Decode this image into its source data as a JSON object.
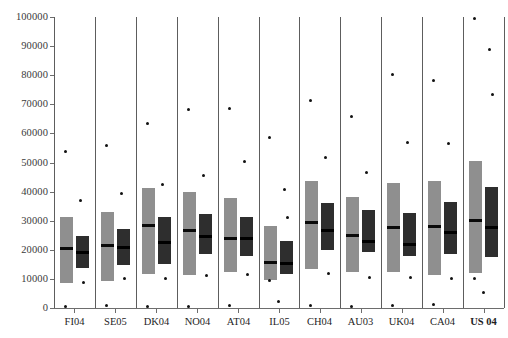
{
  "chart_data": {
    "type": "bar",
    "subtype": "paired-range-bars-with-outliers",
    "title": "",
    "subtitle": "",
    "xlabel": "",
    "ylabel": "",
    "ylim": [
      0,
      100000
    ],
    "grid": false,
    "legend_position": "none",
    "y_ticks": [
      {
        "value": 0,
        "label": "0"
      },
      {
        "value": 10000,
        "label": "10000"
      },
      {
        "value": 20000,
        "label": "20000"
      },
      {
        "value": 30000,
        "label": "30000"
      },
      {
        "value": 40000,
        "label": "40000"
      },
      {
        "value": 50000,
        "label": "50000"
      },
      {
        "value": 60000,
        "label": "60000"
      },
      {
        "value": 70000,
        "label": "70000"
      },
      {
        "value": 80000,
        "label": "80000"
      },
      {
        "value": 90000,
        "label": "90000"
      },
      {
        "value": 100000,
        "label": "100000"
      }
    ],
    "categories": [
      "FI04",
      "SE05",
      "DK04",
      "NO04",
      "AT04",
      "IL05",
      "CH04",
      "AU03",
      "UK04",
      "CA04",
      "US 04"
    ],
    "category_styles": [
      "normal",
      "normal",
      "normal",
      "normal",
      "normal",
      "normal",
      "normal",
      "normal",
      "normal",
      "normal",
      "bold"
    ],
    "series": [
      {
        "name": "light",
        "color": "#8f8f8f",
        "bars": [
          {
            "category": "FI04",
            "low": 8700,
            "high": 31300,
            "median": 20500
          },
          {
            "category": "SE05",
            "low": 9300,
            "high": 32900,
            "median": 21700
          },
          {
            "category": "DK04",
            "low": 11600,
            "high": 41100,
            "median": 28400
          },
          {
            "category": "NO04",
            "low": 11400,
            "high": 39900,
            "median": 26700
          },
          {
            "category": "AT04",
            "low": 12200,
            "high": 37800,
            "median": 23900
          },
          {
            "category": "IL05",
            "low": 9700,
            "high": 28300,
            "median": 15900
          },
          {
            "category": "CH04",
            "low": 13300,
            "high": 43600,
            "median": 29700
          },
          {
            "category": "AU03",
            "low": 12200,
            "high": 38100,
            "median": 25000
          },
          {
            "category": "UK04",
            "low": 12300,
            "high": 42900,
            "median": 27900
          },
          {
            "category": "CA04",
            "low": 11500,
            "high": 43700,
            "median": 28200
          },
          {
            "category": "US 04",
            "low": 12100,
            "high": 50600,
            "median": 30100
          }
        ]
      },
      {
        "name": "dark",
        "color": "#2e2e2e",
        "bars": [
          {
            "category": "FI04",
            "low": 13600,
            "high": 24600,
            "median": 19200
          },
          {
            "category": "SE05",
            "low": 14800,
            "high": 27200,
            "median": 20900
          },
          {
            "category": "DK04",
            "low": 15300,
            "high": 31400,
            "median": 22600
          },
          {
            "category": "NO04",
            "low": 18600,
            "high": 32200,
            "median": 24600
          },
          {
            "category": "AT04",
            "low": 17900,
            "high": 31200,
            "median": 24100
          },
          {
            "category": "IL05",
            "low": 11600,
            "high": 22900,
            "median": 15300
          },
          {
            "category": "CH04",
            "low": 20100,
            "high": 36100,
            "median": 26900
          },
          {
            "category": "AU03",
            "low": 19400,
            "high": 33700,
            "median": 23100
          },
          {
            "category": "UK04",
            "low": 17800,
            "high": 32700,
            "median": 21900
          },
          {
            "category": "CA04",
            "low": 18400,
            "high": 36400,
            "median": 26000
          },
          {
            "category": "US 04",
            "low": 17400,
            "high": 41500,
            "median": 27700
          }
        ]
      }
    ],
    "outliers": [
      {
        "category": "FI04",
        "values": [
          53900,
          37000,
          8900,
          400
        ]
      },
      {
        "category": "SE05",
        "values": [
          55800,
          39300,
          10200,
          800
        ]
      },
      {
        "category": "DK04",
        "values": [
          63500,
          42400,
          10100,
          600
        ]
      },
      {
        "category": "NO04",
        "values": [
          68100,
          45400,
          11200,
          500
        ]
      },
      {
        "category": "AT04",
        "values": [
          68400,
          50200,
          11400,
          700
        ]
      },
      {
        "category": "IL05",
        "values": [
          58600,
          40600,
          31100,
          9500,
          2300
        ]
      },
      {
        "category": "CH04",
        "values": [
          71200,
          51700,
          11800,
          900
        ]
      },
      {
        "category": "AU03",
        "values": [
          65800,
          46400,
          10600,
          500
        ]
      },
      {
        "category": "UK04",
        "values": [
          80100,
          56800,
          10400,
          700
        ]
      },
      {
        "category": "CA04",
        "values": [
          78300,
          56400,
          10300,
          1100
        ]
      },
      {
        "category": "US 04",
        "values": [
          99500,
          88700,
          73300,
          10300,
          5200
        ]
      }
    ]
  }
}
